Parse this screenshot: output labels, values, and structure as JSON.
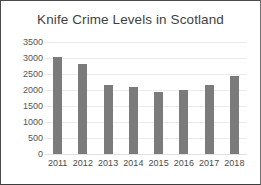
{
  "chart_data": {
    "type": "bar",
    "title": "Knife Crime Levels in Scotland",
    "xlabel": "",
    "ylabel": "",
    "categories": [
      "2011",
      "2012",
      "2013",
      "2014",
      "2015",
      "2016",
      "2017",
      "2018"
    ],
    "values": [
      3030,
      2820,
      2160,
      2100,
      1940,
      1990,
      2150,
      2430
    ],
    "series": [
      {
        "name": "Knife crime incidents",
        "values": [
          3030,
          2820,
          2160,
          2100,
          1940,
          1990,
          2150,
          2430
        ]
      }
    ],
    "ylim": [
      0,
      3500
    ],
    "ytick_step": 500,
    "yticks": [
      0,
      500,
      1000,
      1500,
      2000,
      2500,
      3000,
      3500
    ],
    "ytick_labels": [
      "0",
      "500",
      "1000",
      "1500",
      "2000",
      "2500",
      "3000",
      "3500"
    ],
    "grid": true,
    "grid_axis": "y",
    "legend": false,
    "legend_position": "none",
    "bar_color": "#7b7b7b",
    "title_color": "#3f3f3f",
    "tick_color": "#4a4a4a",
    "gridline_color": "#eceaea",
    "plot_background": "#ffffff",
    "frame_border_color": "#4a4a4a"
  }
}
